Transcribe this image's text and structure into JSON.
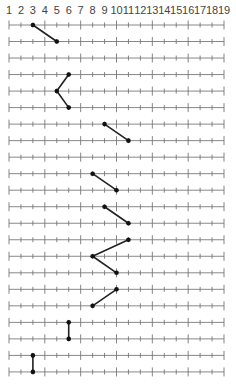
{
  "diagram": {
    "type": "number-line-path",
    "axis_labels": [
      "1",
      "2",
      "3",
      "4",
      "5",
      "6",
      "7",
      "8",
      "9",
      "10",
      "11",
      "12",
      "13",
      "14",
      "15",
      "16",
      "17",
      "18",
      "19"
    ],
    "min": 1,
    "max": 19,
    "major_tick_every": 3,
    "major_tick_values": [
      1,
      4,
      7,
      10,
      13,
      16,
      19
    ],
    "rows": [
      {
        "row": 1,
        "value": 3
      },
      {
        "row": 2,
        "value": 5
      },
      {
        "row": 3,
        "value": null
      },
      {
        "row": 4,
        "value": 6
      },
      {
        "row": 5,
        "value": 5
      },
      {
        "row": 6,
        "value": 6
      },
      {
        "row": 7,
        "value": 9
      },
      {
        "row": 8,
        "value": 11
      },
      {
        "row": 9,
        "value": null
      },
      {
        "row": 10,
        "value": 8
      },
      {
        "row": 11,
        "value": 10
      },
      {
        "row": 12,
        "value": 9
      },
      {
        "row": 13,
        "value": 11
      },
      {
        "row": 14,
        "value": 11
      },
      {
        "row": 15,
        "value": 8
      },
      {
        "row": 16,
        "value": 10
      },
      {
        "row": 17,
        "value": 10
      },
      {
        "row": 18,
        "value": 8
      },
      {
        "row": 19,
        "value": 6
      },
      {
        "row": 20,
        "value": 6
      },
      {
        "row": 21,
        "value": 3
      },
      {
        "row": 22,
        "value": 3
      }
    ],
    "connections": [
      [
        1,
        2
      ],
      [
        4,
        5
      ],
      [
        5,
        6
      ],
      [
        7,
        8
      ],
      [
        10,
        11
      ],
      [
        12,
        13
      ],
      [
        14,
        15
      ],
      [
        15,
        16
      ],
      [
        17,
        18
      ],
      [
        19,
        20
      ],
      [
        21,
        22
      ]
    ],
    "colors": {
      "axis_line": "#888888",
      "tick": "#777777",
      "path": "#222222",
      "dot": "#111111",
      "label": "#444444"
    }
  }
}
